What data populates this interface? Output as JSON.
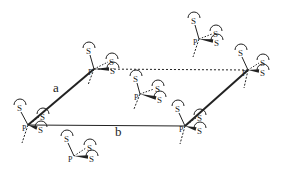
{
  "diagram": {
    "axis_labels": {
      "a": "a",
      "b": "b"
    },
    "atom_labels": {
      "phosphorus": "P",
      "sulfur": "S"
    },
    "colors": {
      "ink": "#222222",
      "background": "#ffffff"
    },
    "lattice": {
      "origin": [
        28,
        125
      ],
      "a_end": [
        94,
        69
      ],
      "b_end": [
        185,
        126
      ],
      "ab_end": [
        248,
        70
      ]
    },
    "units": [
      {
        "id": "origin",
        "p": [
          28,
          125
        ],
        "s_up": [
          20,
          107
        ],
        "s_r1": [
          43,
          116
        ],
        "s_r2": [
          41,
          129
        ],
        "tail": [
          22,
          143
        ]
      },
      {
        "id": "a-corner",
        "p": [
          94,
          69
        ],
        "s_up": [
          89,
          50
        ],
        "s_r1": [
          112,
          61
        ],
        "s_r2": [
          113,
          70
        ],
        "tail": [
          88,
          85
        ]
      },
      {
        "id": "b-corner",
        "p": [
          185,
          126
        ],
        "s_up": [
          178,
          108
        ],
        "s_r1": [
          200,
          117
        ],
        "s_r2": [
          200,
          130
        ],
        "tail": [
          180,
          144
        ]
      },
      {
        "id": "ab-corner",
        "p": [
          248,
          70
        ],
        "s_up": [
          241,
          52
        ],
        "s_r1": [
          263,
          62
        ],
        "s_r2": [
          263,
          72
        ],
        "tail": [
          244,
          88
        ]
      },
      {
        "id": "center",
        "p": [
          140,
          94
        ],
        "s_up": [
          136,
          78
        ],
        "s_r1": [
          158,
          88
        ],
        "s_r2": [
          160,
          99
        ],
        "tail": [
          134,
          109
        ]
      },
      {
        "id": "upper-right",
        "p": [
          199,
          39
        ],
        "s_up": [
          194,
          20
        ],
        "s_r1": [
          216,
          33
        ],
        "s_r2": [
          217,
          42
        ],
        "tail": [
          193,
          57
        ]
      },
      {
        "id": "bottom",
        "p": [
          74,
          156
        ],
        "s_up": [
          67,
          138
        ],
        "s_r1": [
          90,
          147
        ],
        "s_r2": [
          92,
          158
        ],
        "tail": null
      }
    ]
  }
}
